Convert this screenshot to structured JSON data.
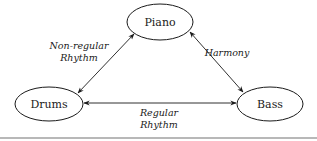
{
  "diagram": {
    "nodes": [
      {
        "id": "piano",
        "label": "Piano"
      },
      {
        "id": "drums",
        "label": "Drums"
      },
      {
        "id": "bass",
        "label": "Bass"
      }
    ],
    "edges": [
      {
        "from": "drums",
        "to": "piano",
        "label_line1": "Non-regular",
        "label_line2": "Rhythm",
        "bidirectional": true
      },
      {
        "from": "piano",
        "to": "bass",
        "label_line1": "Harmony",
        "bidirectional": true
      },
      {
        "from": "drums",
        "to": "bass",
        "label_line1": "Regular",
        "label_line2": "Rhythm",
        "bidirectional": true
      }
    ]
  }
}
